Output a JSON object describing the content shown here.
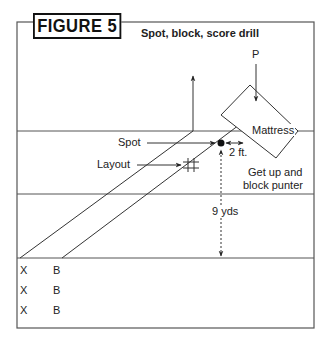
{
  "figure": {
    "title": "FIGURE 5",
    "subtitle": "Spot, block, score drill"
  },
  "labels": {
    "punter": "P",
    "mattress": "Mattress",
    "spot": "Spot",
    "layout": "Layout",
    "distance_ft": "2 ft.",
    "instruction_line1": "Get up and",
    "instruction_line2": "block punter",
    "distance_yds": "9 yds"
  },
  "players": {
    "rows": [
      {
        "x": "X",
        "b": "B"
      },
      {
        "x": "X",
        "b": "B"
      },
      {
        "x": "X",
        "b": "B"
      }
    ]
  },
  "colors": {
    "line": "#333333",
    "text": "#222222",
    "background": "#ffffff"
  }
}
